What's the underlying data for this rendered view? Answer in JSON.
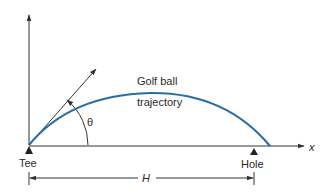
{
  "diagram": {
    "title_labels": {
      "trajectory_line1": "Golf ball",
      "trajectory_line2": "trajectory",
      "angle": "θ",
      "tee": "Tee",
      "hole": "Hole",
      "x_axis": "x",
      "distance": "H"
    },
    "colors": {
      "trajectory": "#2b6ea6",
      "lines": "#333333",
      "text": "#2a2a2a",
      "background": "#ffffff"
    }
  }
}
